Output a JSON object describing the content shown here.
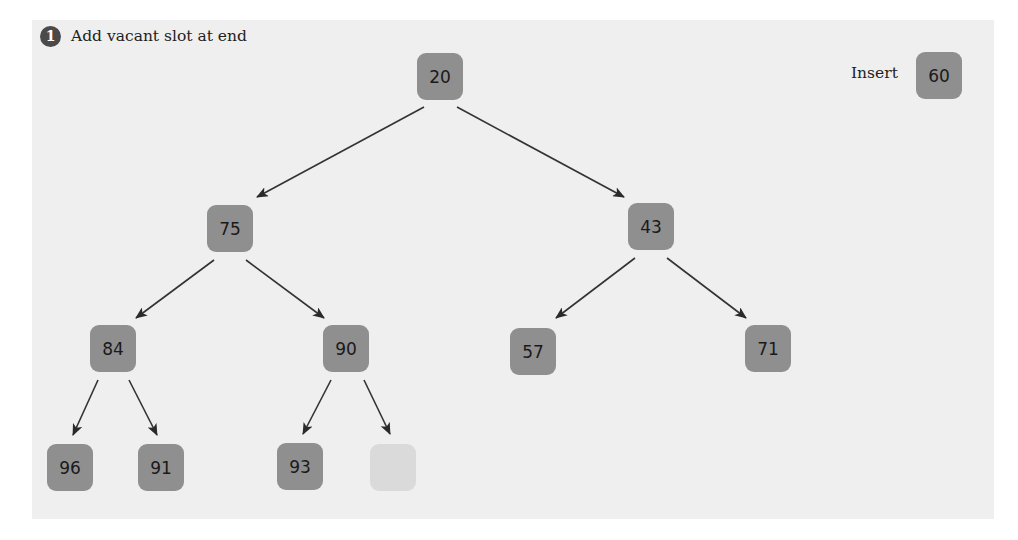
{
  "step": {
    "number": "1",
    "text": "Add vacant slot at end"
  },
  "insert": {
    "label": "Insert",
    "value": "60"
  },
  "colors": {
    "panel_bg": "#efefef",
    "node_fill": "#8f8f8f",
    "vacant_fill": "#dadada",
    "edge": "#333333",
    "badge": "#4a4a4a"
  },
  "tree": {
    "nodes": [
      {
        "id": "n0",
        "value": "20",
        "x": 417,
        "y": 53
      },
      {
        "id": "n1",
        "value": "75",
        "x": 207,
        "y": 205
      },
      {
        "id": "n2",
        "value": "43",
        "x": 628,
        "y": 203
      },
      {
        "id": "n3",
        "value": "84",
        "x": 90,
        "y": 325
      },
      {
        "id": "n4",
        "value": "90",
        "x": 323,
        "y": 325
      },
      {
        "id": "n5",
        "value": "57",
        "x": 510,
        "y": 328
      },
      {
        "id": "n6",
        "value": "71",
        "x": 745,
        "y": 325
      },
      {
        "id": "n7",
        "value": "96",
        "x": 47,
        "y": 444
      },
      {
        "id": "n8",
        "value": "91",
        "x": 138,
        "y": 444
      },
      {
        "id": "n9",
        "value": "93",
        "x": 277,
        "y": 443
      },
      {
        "id": "n10",
        "value": "",
        "x": 370,
        "y": 444,
        "vacant": true
      }
    ],
    "edges": [
      {
        "from": "20",
        "to": "75"
      },
      {
        "from": "20",
        "to": "43"
      },
      {
        "from": "75",
        "to": "84"
      },
      {
        "from": "75",
        "to": "90"
      },
      {
        "from": "43",
        "to": "57"
      },
      {
        "from": "43",
        "to": "71"
      },
      {
        "from": "84",
        "to": "96"
      },
      {
        "from": "84",
        "to": "91"
      },
      {
        "from": "90",
        "to": "93"
      },
      {
        "from": "90",
        "to": "vacant"
      }
    ]
  }
}
